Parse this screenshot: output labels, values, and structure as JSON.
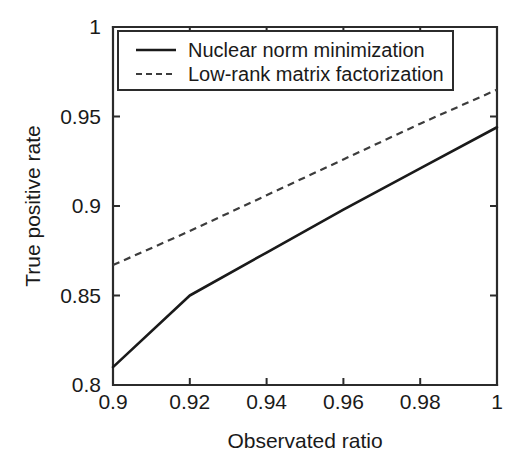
{
  "chart_data": {
    "type": "line",
    "title": "",
    "xlabel": "Observated ratio",
    "ylabel": "True positive rate",
    "xlim": [
      0.9,
      1.0
    ],
    "ylim": [
      0.8,
      1.0
    ],
    "xticks": [
      "0.9",
      "0.92",
      "0.94",
      "0.96",
      "0.98",
      "1"
    ],
    "xtick_values": [
      0.9,
      0.92,
      0.94,
      0.96,
      0.98,
      1.0
    ],
    "yticks": [
      "0.8",
      "0.85",
      "0.9",
      "0.95",
      "1"
    ],
    "ytick_values": [
      0.8,
      0.85,
      0.9,
      0.95,
      1.0
    ],
    "grid": false,
    "legend_position": "top-left-inside",
    "series": [
      {
        "name": "Nuclear norm minimization",
        "style": "solid",
        "color": "#1a1a1a",
        "x": [
          0.9,
          0.92,
          0.94,
          0.96,
          0.98,
          1.0
        ],
        "values": [
          0.81,
          0.85,
          0.874,
          0.898,
          0.921,
          0.944
        ]
      },
      {
        "name": "Low-rank matrix factorization",
        "style": "dashed",
        "color": "#3c3c3c",
        "x": [
          0.9,
          0.92,
          0.94,
          0.96,
          0.98,
          1.0
        ],
        "values": [
          0.867,
          0.886,
          0.906,
          0.926,
          0.946,
          0.965
        ]
      }
    ]
  },
  "legend": {
    "entries": [
      {
        "label": "Nuclear norm minimization",
        "style": "solid"
      },
      {
        "label": "Low-rank matrix factorization",
        "style": "dashed"
      }
    ]
  },
  "axes": {
    "x_title": "Observated ratio",
    "y_title": "True positive rate"
  }
}
